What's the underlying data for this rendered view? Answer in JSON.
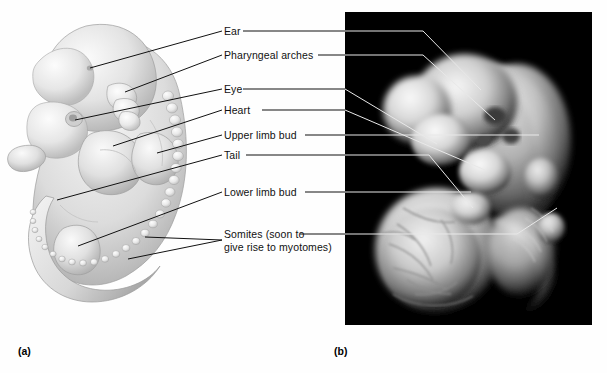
{
  "figure": {
    "panels": [
      {
        "id": "a",
        "caption": "(a)",
        "type": "illustration",
        "subject": "human embryo lateral view drawing"
      },
      {
        "id": "b",
        "caption": "(b)",
        "type": "photograph",
        "subject": "human embryo photograph with yolk sac"
      }
    ]
  },
  "labels": [
    {
      "key": "ear",
      "text": "Ear",
      "text2": ""
    },
    {
      "key": "pharyngeal",
      "text": "Pharyngeal arches",
      "text2": ""
    },
    {
      "key": "eye",
      "text": "Eye",
      "text2": ""
    },
    {
      "key": "heart",
      "text": "Heart",
      "text2": ""
    },
    {
      "key": "upper_limb_bud",
      "text": "Upper limb bud",
      "text2": ""
    },
    {
      "key": "tail",
      "text": "Tail",
      "text2": ""
    },
    {
      "key": "lower_limb_bud",
      "text": "Lower limb bud",
      "text2": ""
    },
    {
      "key": "somites",
      "text": "Somites (soon to",
      "text2": "give rise to myotomes)"
    }
  ],
  "captions": {
    "a": "(a)",
    "b": "(b)"
  },
  "colors": {
    "background": "#fefefe",
    "text": "#111111",
    "leader_line_left": "#111111",
    "leader_line_photo": "#e8e8e8",
    "photo_background": "#000000",
    "illustration_light": "#f2f2f2",
    "illustration_mid": "#c9c9c9",
    "illustration_shadow": "#9a9a9a"
  }
}
